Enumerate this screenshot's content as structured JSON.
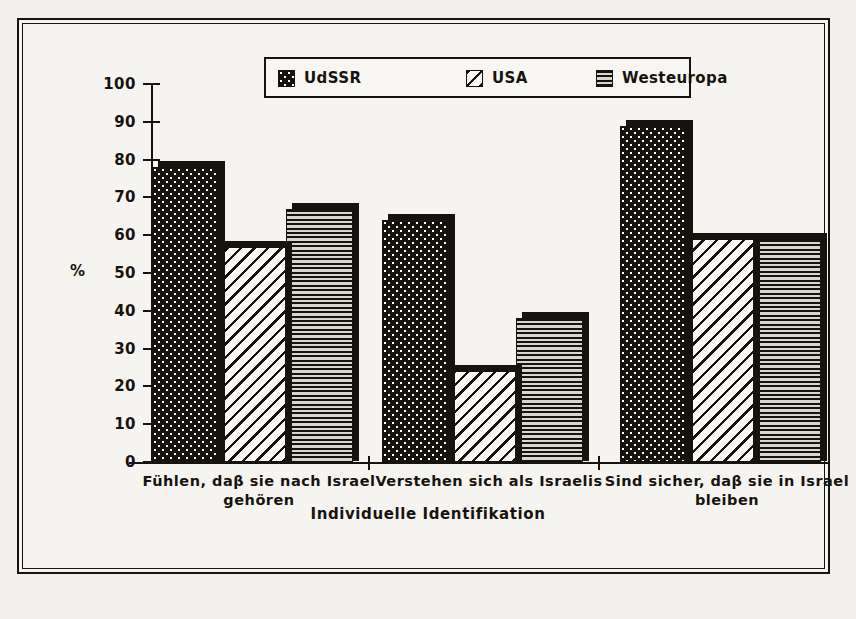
{
  "chart_data": {
    "type": "bar",
    "title": "",
    "xlabel": "Individuelle Identifikation",
    "ylabel": "%",
    "ylim": [
      0,
      100
    ],
    "ytick_step": 10,
    "yticks": [
      "0",
      "10",
      "20",
      "30",
      "40",
      "50",
      "60",
      "70",
      "80",
      "90",
      "100"
    ],
    "grid": false,
    "legend_position": "top-center",
    "categories": [
      "Fühlen, daβ sie nach Israel gehören",
      "Verstehen sich als Israelis",
      "Sind sicher, daβ sie in Israel bleiben"
    ],
    "category_lines": [
      [
        "Fühlen, daβ sie nach Israel",
        "gehören"
      ],
      [
        "Verstehen sich als Israelis",
        ""
      ],
      [
        "Sind sicher, daβ sie in Israel",
        "bleiben"
      ]
    ],
    "series": [
      {
        "name": "UdSSR",
        "pattern": "checkerboard-dots",
        "values": [
          78,
          64,
          89
        ]
      },
      {
        "name": "USA",
        "pattern": "diagonal-hatch",
        "values": [
          57,
          24,
          59
        ]
      },
      {
        "name": "Westeuropa",
        "pattern": "horizontal-lines",
        "values": [
          67,
          38,
          59
        ]
      }
    ]
  },
  "legend": {
    "items": [
      {
        "label": "UdSSR",
        "swatch": "checkerboard-dots"
      },
      {
        "label": "USA",
        "swatch": "diagonal-hatch"
      },
      {
        "label": "Westeuropa",
        "swatch": "horizontal-lines"
      }
    ]
  },
  "colors": {
    "ink": "#16130f",
    "paper": "#f6f4f0",
    "page": "#f2f0ec"
  }
}
